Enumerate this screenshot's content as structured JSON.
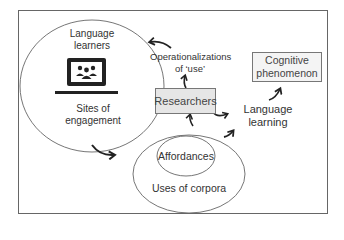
{
  "diagram": {
    "nodes": {
      "language_learners": "Language learners",
      "language_learners_line1": "Language",
      "language_learners_line2": "learners",
      "sites_line1": "Sites of",
      "sites_line2": "engagement",
      "operationalizations_line1": "Operationalizations",
      "operationalizations_line2": "of ‘use’",
      "researchers": "Researchers",
      "cognitive_line1": "Cognitive",
      "cognitive_line2": "phenomenon",
      "language_learning_line1": "Language",
      "language_learning_line2": "learning",
      "affordances": "Affordances",
      "uses_of_corpora": "Uses of corpora"
    },
    "icons": {
      "laptop": "laptop-with-group-icon"
    },
    "edges": [
      {
        "from": "Operationalizations of 'use'",
        "to": "Language learners / Sites of engagement circle"
      },
      {
        "from": "Sites of engagement",
        "to": "Uses of corpora"
      },
      {
        "from": "Uses of corpora",
        "to": "Researchers"
      },
      {
        "from": "Researchers",
        "to": "Operationalizations of 'use'"
      },
      {
        "from": "Researchers",
        "to": "Language learning"
      },
      {
        "from": "Uses of corpora",
        "to": "Language learning"
      },
      {
        "from": "Language learning",
        "to": "Cognitive phenomenon"
      }
    ],
    "colors": {
      "stroke": "#555555",
      "box_fill": "#e6e6e6",
      "text": "#333333"
    }
  }
}
